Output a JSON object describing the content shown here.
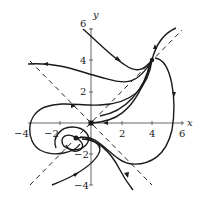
{
  "figure": {
    "type": "phase-portrait",
    "axes": {
      "x_label": "x",
      "y_label": "y",
      "x_ticks": [
        {
          "value": -4,
          "label": "−4"
        },
        {
          "value": -2,
          "label": "−2"
        },
        {
          "value": 2,
          "label": "2"
        },
        {
          "value": 4,
          "label": "4"
        },
        {
          "value": 6,
          "label": "6"
        }
      ],
      "y_ticks": [
        {
          "value": 6,
          "label": "6"
        },
        {
          "value": 4,
          "label": "4"
        },
        {
          "value": 2,
          "label": "2"
        },
        {
          "value": -2,
          "label": "−2"
        },
        {
          "value": -4,
          "label": "−4"
        }
      ],
      "x_range": [
        -4,
        6
      ],
      "y_range": [
        -4,
        6
      ]
    },
    "critical_points": [
      {
        "name": "saddle-origin",
        "x": 0,
        "y": 0
      },
      {
        "name": "node-upper-right",
        "x": 4,
        "y": 4
      },
      {
        "name": "spiral-lower-left",
        "x": -1,
        "y": -1
      }
    ],
    "dashed_lines": [
      {
        "name": "line-y-equals-x",
        "from": [
          -4,
          -4
        ],
        "to": [
          6,
          6
        ]
      },
      {
        "name": "line-y-equals-neg-x",
        "from": [
          -4,
          4
        ],
        "to": [
          4,
          -4
        ]
      }
    ],
    "colors": {
      "curve": "#1a1a1a",
      "axis": "#555555",
      "background": "#ffffff"
    }
  }
}
